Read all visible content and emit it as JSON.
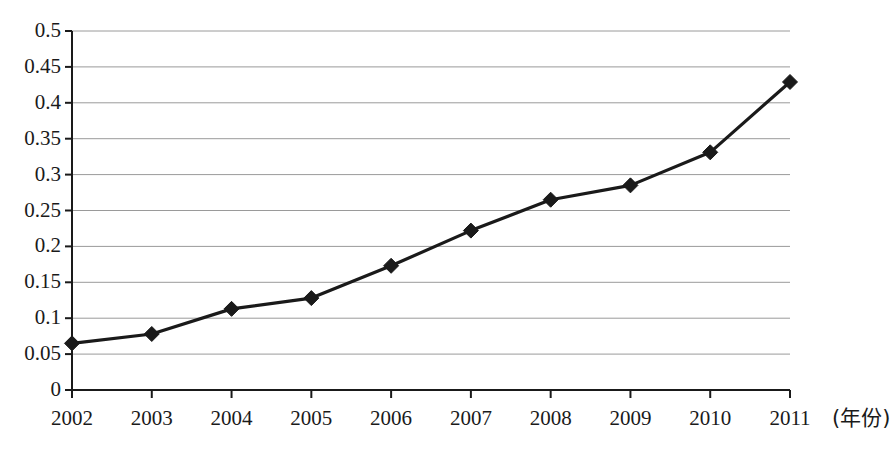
{
  "chart_data": {
    "type": "line",
    "title": "",
    "subtitle": "",
    "xlabel": "(年份)",
    "ylabel": "",
    "x": [
      2002,
      2003,
      2004,
      2005,
      2006,
      2007,
      2008,
      2009,
      2010,
      2011
    ],
    "categories": [
      "2002",
      "2003",
      "2004",
      "2005",
      "2006",
      "2007",
      "2008",
      "2009",
      "2010",
      "2011"
    ],
    "values": [
      0.065,
      0.078,
      0.113,
      0.128,
      0.173,
      0.222,
      0.265,
      0.285,
      0.331,
      0.429
    ],
    "series": [
      {
        "name": "",
        "values": [
          0.065,
          0.078,
          0.113,
          0.128,
          0.173,
          0.222,
          0.265,
          0.285,
          0.331,
          0.429
        ]
      }
    ],
    "ylim": [
      0,
      0.5
    ],
    "ytick_values": [
      0,
      0.05,
      0.1,
      0.15,
      0.2,
      0.25,
      0.3,
      0.35,
      0.4,
      0.45,
      0.5
    ],
    "ytick_labels": [
      "0",
      "0.05",
      "0.1",
      "0.15",
      "0.2",
      "0.25",
      "0.3",
      "0.35",
      "0.4",
      "0.45",
      "0.5"
    ],
    "xtick_labels": [
      "2002",
      "2003",
      "2004",
      "2005",
      "2006",
      "2007",
      "2008",
      "2009",
      "2010",
      "2011"
    ],
    "grid": true,
    "grid_axis": "y",
    "legend": false,
    "legend_position": "none",
    "marker": "diamond",
    "line_color": "#1a1a1a",
    "marker_color": "#1a1a1a",
    "grid_color": "#9a9a9a",
    "axis_color": "#1a1a1a",
    "background_color": "#ffffff",
    "annotations": []
  }
}
